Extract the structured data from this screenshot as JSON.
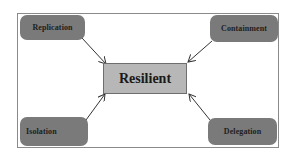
{
  "diagram": {
    "center": {
      "label": "Resilient"
    },
    "nodes": [
      {
        "id": "replication",
        "label": "Replication",
        "position": "top-left"
      },
      {
        "id": "containment",
        "label": "Containment",
        "position": "top-right"
      },
      {
        "id": "isolation",
        "label": "Isolation",
        "position": "bottom-left"
      },
      {
        "id": "delegation",
        "label": "Delegation",
        "position": "bottom-right"
      }
    ],
    "edges": [
      {
        "from": "replication",
        "to": "center"
      },
      {
        "from": "containment",
        "to": "center"
      },
      {
        "from": "isolation",
        "to": "center"
      },
      {
        "from": "delegation",
        "to": "center"
      }
    ],
    "colors": {
      "node_fill": "#7a7a7a",
      "center_fill": "#b7b7b7",
      "arrow": "#333333",
      "frame": "#8a8a8a"
    }
  }
}
